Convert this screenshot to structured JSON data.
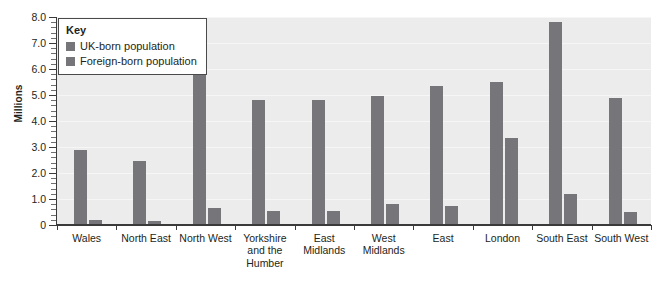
{
  "chart_data": {
    "type": "bar",
    "title": "",
    "xlabel": "",
    "ylabel": "Millions",
    "ylim": [
      0,
      8.0
    ],
    "ytick_labels": [
      "0",
      "1.0",
      "2.0",
      "3.0",
      "4.0",
      "5.0",
      "6.0",
      "7.0",
      "8.0"
    ],
    "ytick_values": [
      0,
      1.0,
      2.0,
      3.0,
      4.0,
      5.0,
      6.0,
      7.0,
      8.0
    ],
    "minor_tick_step": 0.2,
    "grid": true,
    "legend_position": "top-left",
    "legend_title": "Key",
    "categories": [
      "Wales",
      "North East",
      "North West",
      "Yorkshire and the Humber",
      "East Midlands",
      "West Midlands",
      "East",
      "London",
      "South East",
      "South West"
    ],
    "category_lines": [
      [
        "Wales"
      ],
      [
        "North East"
      ],
      [
        "North West"
      ],
      [
        "Yorkshire",
        "and the",
        "Humber"
      ],
      [
        "East",
        "Midlands"
      ],
      [
        "West",
        "Midlands"
      ],
      [
        "East"
      ],
      [
        "London"
      ],
      [
        "South East"
      ],
      [
        "South West"
      ]
    ],
    "series": [
      {
        "name": "UK-born population",
        "color": "#76767a",
        "values": [
          2.9,
          2.45,
          6.45,
          4.8,
          4.8,
          4.95,
          5.35,
          5.5,
          7.8,
          4.9
        ]
      },
      {
        "name": "Foreign-born population",
        "color": "#76767a",
        "values": [
          0.2,
          0.15,
          0.65,
          0.55,
          0.55,
          0.8,
          0.75,
          3.35,
          1.2,
          0.5
        ]
      }
    ]
  },
  "colors": {
    "plot_background": "#ececec",
    "gridline": "#f6f6f6",
    "axis": "#3a3a3a",
    "bar": "#76767a",
    "text": "#231f20",
    "page_background": "#ffffff"
  }
}
